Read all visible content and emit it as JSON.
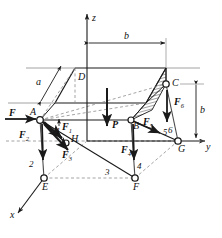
{
  "figure": {
    "type": "engineering-statics-free-body-diagram",
    "colors": {
      "stroke": "#1a1a1a",
      "dashed": "#7a7a7a",
      "hatch": "#555555",
      "background": "#ffffff"
    }
  },
  "axes": [
    {
      "name": "z-axis",
      "label": "z",
      "direction": "up"
    },
    {
      "name": "y-axis",
      "label": "y",
      "direction": "right"
    },
    {
      "name": "x-axis",
      "label": "x",
      "direction": "lower-left"
    }
  ],
  "nodes": [
    {
      "id": "A",
      "label": "A"
    },
    {
      "id": "B",
      "label": "B"
    },
    {
      "id": "C",
      "label": "C"
    },
    {
      "id": "D",
      "label": "D"
    },
    {
      "id": "E",
      "label": "E"
    },
    {
      "id": "F",
      "label": "F"
    },
    {
      "id": "G",
      "label": "G"
    },
    {
      "id": "H",
      "label": "H"
    }
  ],
  "members": [
    {
      "id": "1",
      "label": "1"
    },
    {
      "id": "2",
      "label": "2"
    },
    {
      "id": "3",
      "label": "3"
    },
    {
      "id": "4",
      "label": "4"
    },
    {
      "id": "5",
      "label": "5"
    },
    {
      "id": "6",
      "label": "6"
    }
  ],
  "forces": [
    {
      "id": "F",
      "label": "F",
      "subscript": "",
      "direction": "right",
      "at": "A"
    },
    {
      "id": "F1",
      "label": "F",
      "subscript": "1",
      "direction": "lower-right",
      "at": "A"
    },
    {
      "id": "F2",
      "label": "F",
      "subscript": "2",
      "direction": "down",
      "at": "A"
    },
    {
      "id": "F3",
      "label": "F",
      "subscript": "3",
      "direction": "lower-right",
      "at": "A"
    },
    {
      "id": "F4",
      "label": "F",
      "subscript": "4",
      "direction": "down",
      "at": "B"
    },
    {
      "id": "F5",
      "label": "F",
      "subscript": "5",
      "direction": "lower-right",
      "at": "B"
    },
    {
      "id": "F6",
      "label": "F",
      "subscript": "6",
      "direction": "down",
      "at": "C"
    },
    {
      "id": "P",
      "label": "P",
      "subscript": "",
      "direction": "down",
      "at": "plate-center"
    }
  ],
  "dimensions": [
    {
      "id": "a",
      "label": "a",
      "orientation": "oblique",
      "note": "plate depth along x"
    },
    {
      "id": "b-top",
      "label": "b",
      "orientation": "horizontal",
      "note": "plate width along y"
    },
    {
      "id": "b-right",
      "label": "b",
      "orientation": "vertical",
      "note": "height of member 6"
    }
  ]
}
